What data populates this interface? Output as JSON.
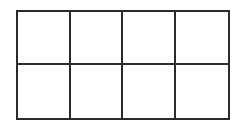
{
  "diagram": {
    "type": "grid",
    "rows": 2,
    "columns": 4,
    "line_color": "#2b2b2b",
    "background": "#ffffff",
    "cells": [
      [
        "",
        "",
        "",
        ""
      ],
      [
        "",
        "",
        "",
        ""
      ]
    ]
  }
}
